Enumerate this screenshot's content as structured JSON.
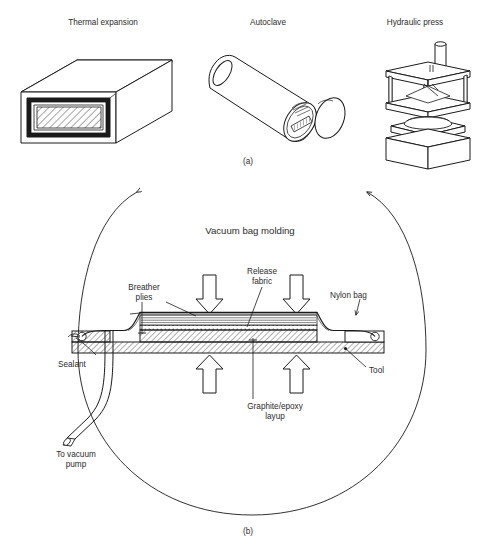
{
  "figure": {
    "part_a": {
      "caption": "(a)",
      "items": [
        {
          "label": "Thermal expansion",
          "x": 103,
          "y": 22
        },
        {
          "label": "Autoclave",
          "x": 268,
          "y": 22
        },
        {
          "label": "Hydraulic press",
          "x": 415,
          "y": 22
        }
      ]
    },
    "part_b": {
      "caption": "(b)",
      "title": "Vacuum bag molding",
      "labels": [
        {
          "name": "breather-plies",
          "text": "Breather\nplies",
          "x": 144,
          "y": 283
        },
        {
          "name": "release-fabric",
          "text": "Release\nfabric",
          "x": 262,
          "y": 267
        },
        {
          "name": "nylon-bag",
          "text": "Nylon bag",
          "x": 357,
          "y": 291
        },
        {
          "name": "sealant",
          "text": "Sealant",
          "x": 89,
          "y": 360
        },
        {
          "name": "tool",
          "text": "Tool",
          "x": 369,
          "y": 370
        },
        {
          "name": "graphite-epoxy-layup",
          "text": "Graphite/epoxy\nlayup",
          "x": 275,
          "y": 406
        },
        {
          "name": "to-vacuum-pump",
          "text": "To vacuum\npump",
          "x": 76,
          "y": 454
        }
      ],
      "pressure_arrows": {
        "down_count": 2,
        "up_count": 2
      }
    },
    "figure_caption": ""
  }
}
